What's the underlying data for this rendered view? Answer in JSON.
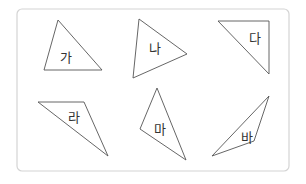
{
  "frame": {
    "x": 17,
    "y": 9,
    "w": 272,
    "h": 162,
    "radius": 5,
    "stroke": "#d4d4d4"
  },
  "shapes": [
    {
      "label": "가",
      "points": "58,20 44,70 102,70",
      "lx": 60,
      "ly": 62
    },
    {
      "label": "나",
      "points": "139,19 133,78 187,54",
      "lx": 149,
      "ly": 53
    },
    {
      "label": "다",
      "points": "218,21 269,21 269,74",
      "lx": 249,
      "ly": 43
    },
    {
      "label": "라",
      "points": "38,102 84,102 108,156",
      "lx": 68,
      "ly": 122
    },
    {
      "label": "마",
      "points": "157,88 140,129 186,160",
      "lx": 154,
      "ly": 134
    },
    {
      "label": "바",
      "points": "269,96 212,156 254,141",
      "lx": 241,
      "ly": 142
    }
  ],
  "stroke_color": "#555555"
}
